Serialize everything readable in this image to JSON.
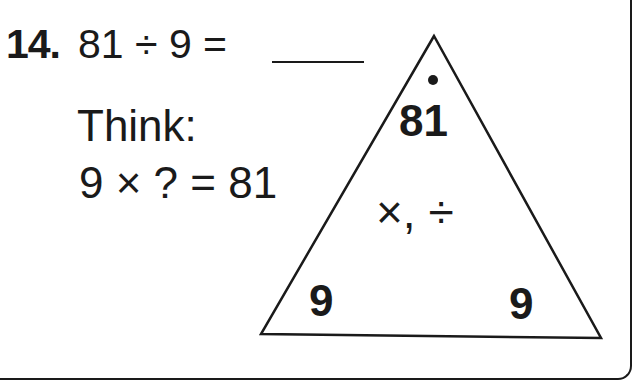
{
  "problem": {
    "number": "14.",
    "expression": "81 ÷ 9 =",
    "answer_blank": ""
  },
  "hint": {
    "label": "Think:",
    "equation": "9 × ? = 81"
  },
  "fact_triangle": {
    "top": "81",
    "bottom_left": "9",
    "bottom_right": "9",
    "operations": "×, ÷",
    "top_marker": "dot"
  },
  "colors": {
    "ink": "#1a1a1a",
    "background": "#ffffff"
  }
}
